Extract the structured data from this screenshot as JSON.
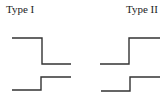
{
  "labels": {
    "type1": "Type I",
    "type2": "Type II"
  },
  "diagram": {
    "stroke_color": "#333333",
    "type1": {
      "upper_trace": "high-to-low step (falling edge)",
      "lower_trace": "low-to-high step (rising edge)"
    },
    "type2": {
      "upper_trace": "low-to-high step (rising edge)",
      "lower_trace": "low-to-high step (rising edge)"
    }
  }
}
